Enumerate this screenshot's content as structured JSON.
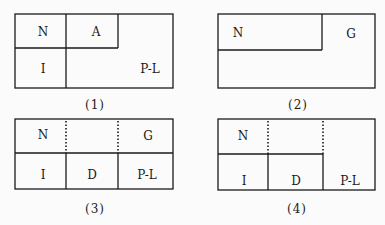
{
  "panels": [
    {
      "caption": "(1)",
      "labels": {
        "n": "N",
        "a": "A",
        "i": "I",
        "pl": "P-L"
      }
    },
    {
      "caption": "(2)",
      "labels": {
        "n": "N",
        "g": "G"
      }
    },
    {
      "caption": "(3)",
      "labels": {
        "n": "N",
        "g": "G",
        "i": "I",
        "d": "D",
        "pl": "P-L"
      }
    },
    {
      "caption": "(4)",
      "labels": {
        "n": "N",
        "i": "I",
        "d": "D",
        "pl": "P-L"
      }
    }
  ],
  "colors": {
    "line": "#1a1a1a",
    "background": "#fbfbfb"
  }
}
